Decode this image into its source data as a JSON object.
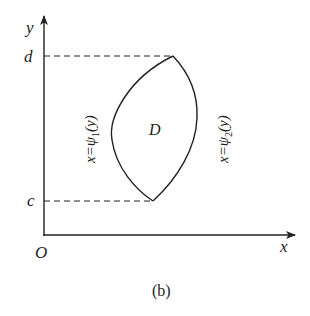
{
  "figure": {
    "caption": "(b)",
    "region_label": "D",
    "axes": {
      "x_label": "x",
      "y_label": "y",
      "origin_label": "O"
    },
    "bounds": {
      "upper_label": "d",
      "lower_label": "c"
    },
    "curves": {
      "left": {
        "prefix": "x=ψ",
        "subscript": "1",
        "suffix": "(y)"
      },
      "right": {
        "prefix": "x=ψ",
        "subscript": "2",
        "suffix": "(y)"
      }
    },
    "colors": {
      "ink": "#222222",
      "background": "#ffffff"
    }
  }
}
